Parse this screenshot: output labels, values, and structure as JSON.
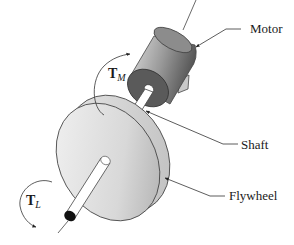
{
  "diagram": {
    "labels": {
      "motor": "Motor",
      "shaft": "Shaft",
      "flywheel": "Flywheel"
    },
    "torques": {
      "motor": {
        "symbol": "T",
        "subscript": "M"
      },
      "load": {
        "symbol": "T",
        "subscript": "L"
      }
    },
    "colors": {
      "background": "#ffffff",
      "motor_body_light": "#d9d9d9",
      "motor_body_dark": "#6e6e6e",
      "motor_face": "#5a5a5a",
      "flywheel_light": "#f0f0f0",
      "flywheel_dark": "#b5b5b5",
      "shaft": "#ffffff",
      "shaft_end": "#111111",
      "lines": "#333333"
    }
  }
}
